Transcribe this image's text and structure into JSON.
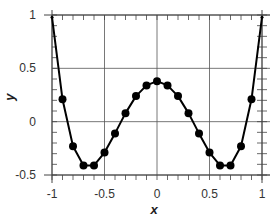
{
  "chart_data": {
    "type": "line",
    "title": "",
    "xlabel": "x",
    "ylabel": "y",
    "xlim": [
      -1,
      1
    ],
    "ylim": [
      -0.5,
      1
    ],
    "grid": true,
    "x_ticks": [
      -1,
      -0.5,
      0,
      0.5,
      1
    ],
    "x_tick_labels": [
      "-1",
      "-0.5",
      "0",
      "0.5",
      "1"
    ],
    "y_ticks": [
      -0.5,
      0,
      0.5,
      1
    ],
    "y_tick_labels": [
      "-0.5",
      "0",
      "0.5",
      "1"
    ],
    "legend": null,
    "series": [
      {
        "name": "y",
        "color": "#000000",
        "marker": "circle",
        "x": [
          -1,
          -0.9,
          -0.8,
          -0.7,
          -0.6,
          -0.5,
          -0.4,
          -0.3,
          -0.2,
          -0.1,
          0,
          0.1,
          0.2,
          0.3,
          0.4,
          0.5,
          0.6,
          0.7,
          0.8,
          0.9,
          1
        ],
        "y": [
          0.98,
          0.21,
          -0.23,
          -0.41,
          -0.41,
          -0.29,
          -0.11,
          0.08,
          0.24,
          0.34,
          0.38,
          0.34,
          0.24,
          0.08,
          -0.11,
          -0.29,
          -0.41,
          -0.41,
          -0.23,
          0.21,
          0.98
        ]
      }
    ]
  }
}
